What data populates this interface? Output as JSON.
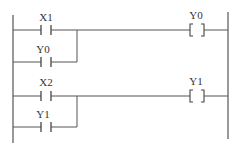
{
  "diagram": {
    "type": "ladder-logic",
    "colors": {
      "line": "#555555",
      "text": "#333333",
      "background": "#ffffff"
    },
    "rungs": [
      {
        "contact": {
          "label": "X1",
          "type": "normally-open"
        },
        "parallel_contact": {
          "label": "Y0",
          "type": "normally-open"
        },
        "coil": {
          "label": "Y0",
          "symbol": "[ ]"
        }
      },
      {
        "contact": {
          "label": "X2",
          "type": "normally-open"
        },
        "parallel_contact": {
          "label": "Y1",
          "type": "normally-open"
        },
        "coil": {
          "label": "Y1",
          "symbol": "[ ]"
        }
      }
    ]
  }
}
